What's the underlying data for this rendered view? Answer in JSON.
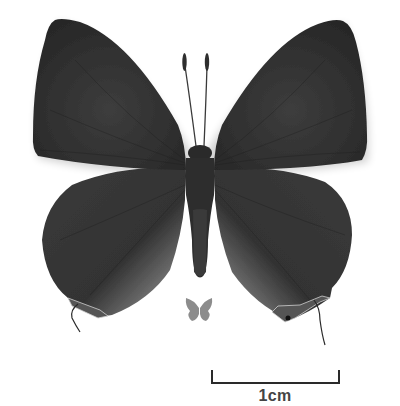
{
  "image": {
    "subject": "butterfly specimen, dorsal view",
    "background_color": "#ffffff",
    "wing_color": "#2f2f2f",
    "hindwing_inner_color": "#8a8a8a",
    "icon_color": "#8c8c8c"
  },
  "size_icon": {
    "description": "small grey butterfly silhouette indicating actual size"
  },
  "scale_bar": {
    "label": "1cm",
    "color": "#2a2a2a"
  }
}
